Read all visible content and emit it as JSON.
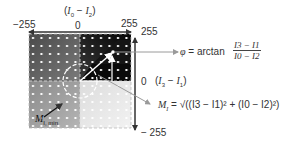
{
  "diagram": {
    "horizontal_axis": {
      "label": "(I0 − I2)",
      "label_parts": {
        "open": "(",
        "a": "I",
        "a_sub": "0",
        "op": " − ",
        "b": "I",
        "b_sub": "2",
        "close": ")"
      },
      "ticks": [
        "−255",
        "0",
        "255"
      ]
    },
    "vertical_axis": {
      "label_parts": {
        "open": "(",
        "a": "I",
        "a_sub": "3",
        "op": " − ",
        "b": "I",
        "b_sub": "1",
        "close": ")"
      },
      "ticks": [
        "255",
        "0",
        "− 255"
      ]
    },
    "phase_formula": {
      "lhs": "φ",
      "eq": " = arctan ",
      "numerator": "I3 − I1",
      "denominator": "I0 − I2"
    },
    "modulation_formula": {
      "lhs": "M",
      "lhs_sub": "I",
      "rhs": " = √((I3 − I1)² + (I0 − I2)²)",
      "rhs_inner": "(I3 − I1)² + (I0 − I2)²"
    },
    "min_label": {
      "main": "M",
      "sub": "I, min"
    },
    "colors": {
      "axis": "#333333",
      "pointer": "#9a9a9a",
      "grid_dark": "#0a0a0a",
      "grid_light": "#eeeeee",
      "dot": "#ffffff"
    }
  }
}
